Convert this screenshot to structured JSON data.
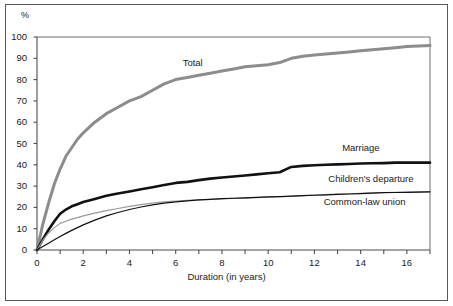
{
  "figure": {
    "y_axis_unit": "%",
    "x_axis_title": "Duration (in years)"
  },
  "chart_data": {
    "type": "line",
    "title": "",
    "subtitle": "",
    "xlabel": "Duration (in years)",
    "ylabel": "%",
    "xlim": [
      0,
      17
    ],
    "ylim": [
      0,
      100
    ],
    "xticks": [
      0,
      2,
      4,
      6,
      8,
      10,
      12,
      14,
      16
    ],
    "xticks_minor_step": 1,
    "yticks": [
      0,
      10,
      20,
      30,
      40,
      50,
      60,
      70,
      80,
      90,
      100
    ],
    "grid": false,
    "legend": "inline-annotations",
    "annotations": [
      {
        "text": "Total",
        "x": 6.3,
        "y": 88
      },
      {
        "text": "Marriage",
        "x": 13.2,
        "y": 48
      },
      {
        "text": "Children's departure",
        "x": 12.6,
        "y": 33.5
      },
      {
        "text": "Common-law union",
        "x": 12.4,
        "y": 22.5
      }
    ],
    "x": [
      0,
      0.25,
      0.5,
      0.75,
      1,
      1.25,
      1.5,
      1.75,
      2,
      2.5,
      3,
      3.5,
      4,
      4.5,
      5,
      5.5,
      6,
      6.5,
      7,
      7.5,
      8,
      8.5,
      9,
      9.5,
      10,
      10.5,
      11,
      11.5,
      12,
      12.5,
      13,
      13.5,
      14,
      14.5,
      15,
      15.5,
      16,
      16.5,
      17
    ],
    "series": [
      {
        "name": "Total",
        "color": "#8c8c8c",
        "width": 3.0,
        "values": [
          0,
          12,
          22,
          31,
          38,
          44,
          48,
          52,
          55,
          60,
          64,
          67,
          70,
          72,
          75,
          78,
          80,
          81,
          82,
          83,
          84,
          85,
          86,
          86.5,
          87,
          88,
          90,
          91,
          91.5,
          92,
          92.5,
          93,
          93.5,
          94,
          94.5,
          95,
          95.5,
          95.8,
          96
        ]
      },
      {
        "name": "Marriage",
        "color": "#111111",
        "width": 2.6,
        "values": [
          0,
          5,
          9.5,
          13.5,
          17,
          19,
          20.5,
          21.5,
          22.5,
          24,
          25.5,
          26.5,
          27.5,
          28.5,
          29.5,
          30.5,
          31.5,
          32,
          32.8,
          33.5,
          34,
          34.5,
          35,
          35.5,
          36,
          36.5,
          39,
          39.5,
          39.8,
          40,
          40.2,
          40.4,
          40.6,
          40.7,
          40.8,
          41,
          41,
          41,
          41
        ]
      },
      {
        "name": "Children's departure",
        "color": "#9a9a9a",
        "width": 1.2,
        "values": [
          0,
          4.5,
          8,
          10.5,
          12.5,
          13.5,
          14.5,
          15.2,
          16,
          17.3,
          18.5,
          19.5,
          20.5,
          21.3,
          22,
          22.6,
          23,
          23.3,
          23.5,
          23.8,
          24,
          24.2,
          24.4,
          24.6,
          24.8,
          25,
          25.2,
          25.5,
          25.8,
          26,
          26.2,
          26.4,
          26.6,
          26.8,
          27,
          27.1,
          27.2,
          27.3,
          27.4
        ]
      },
      {
        "name": "Common-law union",
        "color": "#111111",
        "width": 1.2,
        "values": [
          0,
          1.6,
          3.2,
          4.8,
          6.3,
          7.8,
          9.2,
          10.5,
          11.8,
          14,
          16,
          17.6,
          19,
          20.2,
          21.2,
          22,
          22.6,
          23.1,
          23.5,
          23.8,
          24.1,
          24.3,
          24.5,
          24.7,
          24.9,
          25.1,
          25.3,
          25.5,
          25.7,
          25.9,
          26.1,
          26.3,
          26.5,
          26.7,
          26.9,
          27,
          27.1,
          27.2,
          27.3
        ]
      }
    ]
  }
}
